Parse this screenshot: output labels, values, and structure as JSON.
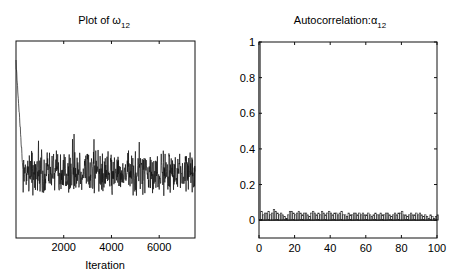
{
  "chart_data": [
    {
      "type": "line",
      "title": "Plot of ω12",
      "title_main": "Plot of ω",
      "title_sub": "12",
      "xlabel": "Iteration",
      "ylabel": "",
      "xlim": [
        0,
        7500
      ],
      "x_ticks": [
        2000,
        4000,
        6000
      ],
      "x_tick_labels": [
        "2000",
        "4000",
        "6000"
      ],
      "y_tick_labels": [],
      "grid": false,
      "description": "MCMC trace: starts near top of axis, drops sharply within first ~300 iterations, then fluctuates noisily around a stable level near the lower third of the plot for the remaining iterations.",
      "burn_in_end": 300,
      "stationary_level_frac": 0.33,
      "noise_amplitude_frac": 0.1,
      "seed": 7
    },
    {
      "type": "bar",
      "title": "Autocorrelation:α12",
      "title_main": "Autocorrelation:α",
      "title_sub": "12",
      "xlabel": "",
      "ylabel": "",
      "xlim": [
        0,
        100
      ],
      "ylim": [
        -0.1,
        1
      ],
      "x_ticks": [
        0,
        20,
        40,
        60,
        80,
        100
      ],
      "x_tick_labels": [
        "0",
        "20",
        "40",
        "60",
        "80",
        "100"
      ],
      "y_ticks": [
        0,
        0.2,
        0.4,
        0.6,
        0.8,
        1
      ],
      "y_tick_labels": [
        "0",
        "0.2",
        "0.4",
        "0.6",
        "0.8",
        "1"
      ],
      "grid": false,
      "lag0_value": 1.0,
      "other_lags_range": [
        0.01,
        0.06
      ],
      "values": [
        1.0,
        0.05,
        0.03,
        0.04,
        0.04,
        0.05,
        0.03,
        0.04,
        0.06,
        0.05,
        0.04,
        0.03,
        0.04,
        0.03,
        0.02,
        0.01,
        0.03,
        0.05,
        0.05,
        0.04,
        0.03,
        0.04,
        0.05,
        0.04,
        0.03,
        0.04,
        0.04,
        0.03,
        0.02,
        0.04,
        0.05,
        0.04,
        0.03,
        0.04,
        0.03,
        0.05,
        0.04,
        0.03,
        0.04,
        0.05,
        0.04,
        0.03,
        0.04,
        0.04,
        0.03,
        0.04,
        0.05,
        0.03,
        0.03,
        0.02,
        0.04,
        0.03,
        0.03,
        0.04,
        0.04,
        0.03,
        0.04,
        0.03,
        0.04,
        0.03,
        0.03,
        0.04,
        0.03,
        0.02,
        0.03,
        0.04,
        0.03,
        0.03,
        0.04,
        0.03,
        0.03,
        0.04,
        0.04,
        0.03,
        0.02,
        0.03,
        0.04,
        0.03,
        0.04,
        0.04,
        0.05,
        0.03,
        0.03,
        0.02,
        0.03,
        0.04,
        0.03,
        0.03,
        0.04,
        0.03,
        0.04,
        0.03,
        0.02,
        0.03,
        0.02,
        0.01,
        0.03,
        0.02,
        0.01,
        0.02,
        0.03
      ]
    }
  ]
}
